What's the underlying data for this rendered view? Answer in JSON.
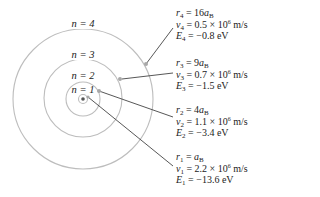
{
  "diagram": {
    "center": [
      83,
      99
    ],
    "colors": {
      "orbit": "#b8b8b8",
      "leader": "#444444",
      "marker": "#a0a0a0",
      "nucleus": "#555555",
      "text": "#222222"
    },
    "orbits": [
      {
        "n_label": "n = 1",
        "radius": 17
      },
      {
        "n_label": "n = 2",
        "radius": 39
      },
      {
        "n_label": "n = 3",
        "radius": 70
      },
      {
        "n_label": "n = 4",
        "radius": 70
      }
    ],
    "levels": [
      {
        "n": "4",
        "r": "16a",
        "r_sub": "B",
        "v_coef": "0.5",
        "v_exp": "6",
        "v_unit": "m/s",
        "E": "−0.8 eV"
      },
      {
        "n": "3",
        "r": "9a",
        "r_sub": "B",
        "v_coef": "0.7",
        "v_exp": "6",
        "v_unit": "m/s",
        "E": "−1.5 eV"
      },
      {
        "n": "2",
        "r": "4a",
        "r_sub": "B",
        "v_coef": "1.1",
        "v_exp": "6",
        "v_unit": "m/s",
        "E": "−3.4 eV"
      },
      {
        "n": "1",
        "r": "a",
        "r_sub": "B",
        "v_coef": "2.2",
        "v_exp": "6",
        "v_unit": "m/s",
        "E": "−13.6 eV"
      }
    ],
    "n_labels": {
      "n4": "n = 4",
      "n3": "n = 3",
      "n2": "n = 2",
      "n1": "n = 1"
    }
  }
}
